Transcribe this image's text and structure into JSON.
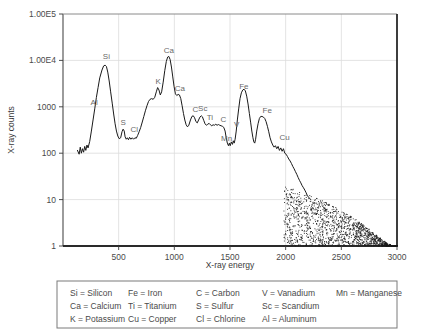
{
  "chart_data": {
    "type": "line",
    "title": "",
    "xlabel": "X-ray energy",
    "ylabel": "X-ray counts",
    "yscale": "log",
    "ylim": [
      1,
      100000
    ],
    "xlim": [
      0,
      3000
    ],
    "grid": true,
    "legend_position": "below-plot",
    "x_ticks": [
      "500",
      "1000",
      "1500",
      "2000",
      "2500",
      "3000"
    ],
    "x_tick_values": [
      500,
      1000,
      1500,
      2000,
      2500,
      3000
    ],
    "y_ticks": [
      "1.00E5",
      "1.00E4",
      "1000",
      "100",
      "10",
      "1"
    ],
    "y_tick_values": [
      100000,
      10000,
      1000,
      100,
      10,
      1
    ],
    "peak_annotations": [
      {
        "label": "Al",
        "x": 280,
        "y": 900
      },
      {
        "label": "Si",
        "x": 390,
        "y": 9000
      },
      {
        "label": "S",
        "x": 540,
        "y": 330
      },
      {
        "label": "Cl",
        "x": 640,
        "y": 230
      },
      {
        "label": "K",
        "x": 855,
        "y": 2600
      },
      {
        "label": "Ca",
        "x": 950,
        "y": 12000
      },
      {
        "label": "Ca",
        "x": 1050,
        "y": 1800
      },
      {
        "label": "C",
        "x": 1190,
        "y": 620
      },
      {
        "label": "Sc",
        "x": 1255,
        "y": 650
      },
      {
        "label": "Ti",
        "x": 1320,
        "y": 430
      },
      {
        "label": "C",
        "x": 1440,
        "y": 380
      },
      {
        "label": "Mn",
        "x": 1470,
        "y": 150
      },
      {
        "label": "V",
        "x": 1560,
        "y": 300
      },
      {
        "label": "Fe",
        "x": 1625,
        "y": 2000
      },
      {
        "label": "Fe",
        "x": 1835,
        "y": 600
      },
      {
        "label": "Cu",
        "x": 1990,
        "y": 160
      }
    ],
    "series": [
      {
        "name": "EDS spectrum",
        "points": [
          [
            130,
            115
          ],
          [
            145,
            95
          ],
          [
            155,
            135
          ],
          [
            165,
            100
          ],
          [
            175,
            125
          ],
          [
            185,
            105
          ],
          [
            195,
            140
          ],
          [
            205,
            115
          ],
          [
            215,
            150
          ],
          [
            225,
            130
          ],
          [
            240,
            180
          ],
          [
            255,
            300
          ],
          [
            270,
            520
          ],
          [
            285,
            900
          ],
          [
            300,
            1600
          ],
          [
            315,
            2600
          ],
          [
            330,
            4200
          ],
          [
            350,
            6200
          ],
          [
            365,
            7600
          ],
          [
            378,
            7900
          ],
          [
            390,
            7400
          ],
          [
            402,
            5600
          ],
          [
            415,
            3600
          ],
          [
            428,
            2100
          ],
          [
            442,
            1200
          ],
          [
            455,
            700
          ],
          [
            468,
            430
          ],
          [
            480,
            300
          ],
          [
            492,
            235
          ],
          [
            505,
            205
          ],
          [
            518,
            215
          ],
          [
            530,
            290
          ],
          [
            540,
            330
          ],
          [
            550,
            300
          ],
          [
            558,
            225
          ],
          [
            568,
            200
          ],
          [
            578,
            215
          ],
          [
            588,
            195
          ],
          [
            598,
            220
          ],
          [
            610,
            200
          ],
          [
            622,
            215
          ],
          [
            634,
            200
          ],
          [
            646,
            215
          ],
          [
            658,
            210
          ],
          [
            670,
            240
          ],
          [
            684,
            290
          ],
          [
            698,
            360
          ],
          [
            712,
            470
          ],
          [
            726,
            620
          ],
          [
            740,
            820
          ],
          [
            754,
            1050
          ],
          [
            768,
            1300
          ],
          [
            782,
            1450
          ],
          [
            796,
            1500
          ],
          [
            810,
            1450
          ],
          [
            824,
            1600
          ],
          [
            838,
            2100
          ],
          [
            850,
            2600
          ],
          [
            862,
            2300
          ],
          [
            874,
            1800
          ],
          [
            886,
            2100
          ],
          [
            900,
            3400
          ],
          [
            914,
            6000
          ],
          [
            928,
            9500
          ],
          [
            940,
            11800
          ],
          [
            950,
            12200
          ],
          [
            962,
            10500
          ],
          [
            974,
            7200
          ],
          [
            986,
            4400
          ],
          [
            998,
            2700
          ],
          [
            1010,
            1900
          ],
          [
            1022,
            1750
          ],
          [
            1034,
            1850
          ],
          [
            1046,
            1800
          ],
          [
            1058,
            1500
          ],
          [
            1070,
            1050
          ],
          [
            1082,
            720
          ],
          [
            1094,
            520
          ],
          [
            1106,
            410
          ],
          [
            1118,
            370
          ],
          [
            1130,
            400
          ],
          [
            1145,
            520
          ],
          [
            1158,
            620
          ],
          [
            1170,
            640
          ],
          [
            1182,
            580
          ],
          [
            1194,
            480
          ],
          [
            1206,
            450
          ],
          [
            1218,
            520
          ],
          [
            1230,
            600
          ],
          [
            1242,
            640
          ],
          [
            1252,
            610
          ],
          [
            1264,
            510
          ],
          [
            1276,
            430
          ],
          [
            1288,
            400
          ],
          [
            1300,
            420
          ],
          [
            1312,
            440
          ],
          [
            1324,
            410
          ],
          [
            1336,
            390
          ],
          [
            1348,
            410
          ],
          [
            1360,
            400
          ],
          [
            1372,
            420
          ],
          [
            1384,
            400
          ],
          [
            1396,
            415
          ],
          [
            1408,
            400
          ],
          [
            1420,
            390
          ],
          [
            1432,
            380
          ],
          [
            1444,
            360
          ],
          [
            1456,
            300
          ],
          [
            1466,
            215
          ],
          [
            1476,
            165
          ],
          [
            1486,
            145
          ],
          [
            1494,
            165
          ],
          [
            1502,
            145
          ],
          [
            1512,
            175
          ],
          [
            1522,
            155
          ],
          [
            1530,
            185
          ],
          [
            1538,
            165
          ],
          [
            1546,
            200
          ],
          [
            1556,
            300
          ],
          [
            1566,
            520
          ],
          [
            1578,
            900
          ],
          [
            1590,
            1500
          ],
          [
            1602,
            2000
          ],
          [
            1614,
            2300
          ],
          [
            1626,
            2400
          ],
          [
            1638,
            2200
          ],
          [
            1650,
            1700
          ],
          [
            1662,
            1150
          ],
          [
            1674,
            720
          ],
          [
            1686,
            450
          ],
          [
            1696,
            300
          ],
          [
            1706,
            215
          ],
          [
            1714,
            175
          ],
          [
            1722,
            165
          ],
          [
            1730,
            200
          ],
          [
            1740,
            300
          ],
          [
            1752,
            430
          ],
          [
            1764,
            560
          ],
          [
            1776,
            620
          ],
          [
            1788,
            620
          ],
          [
            1800,
            600
          ],
          [
            1812,
            560
          ],
          [
            1824,
            480
          ],
          [
            1836,
            380
          ],
          [
            1848,
            290
          ],
          [
            1860,
            215
          ],
          [
            1872,
            175
          ],
          [
            1884,
            150
          ],
          [
            1896,
            135
          ],
          [
            1908,
            145
          ],
          [
            1920,
            125
          ],
          [
            1932,
            140
          ],
          [
            1944,
            115
          ],
          [
            1956,
            130
          ],
          [
            1968,
            110
          ],
          [
            1980,
            125
          ],
          [
            1992,
            100
          ],
          [
            2004,
            95
          ],
          [
            2016,
            85
          ],
          [
            2028,
            75
          ],
          [
            2040,
            68
          ],
          [
            2052,
            60
          ],
          [
            2064,
            52
          ],
          [
            2076,
            46
          ],
          [
            2088,
            40
          ],
          [
            2100,
            35
          ],
          [
            2112,
            30
          ],
          [
            2124,
            26
          ],
          [
            2136,
            23
          ],
          [
            2148,
            20
          ],
          [
            2160,
            18
          ],
          [
            2172,
            16
          ],
          [
            2184,
            14
          ],
          [
            2196,
            12
          ],
          [
            2210,
            11
          ],
          [
            2225,
            10
          ]
        ]
      }
    ],
    "noise_cloud": {
      "description": "scattered low-count points at high energy",
      "x_range": [
        1980,
        3000
      ],
      "y_range": [
        1,
        20
      ]
    }
  },
  "legend": {
    "rows": [
      [
        "Si = Silicon",
        "Fe = Iron",
        "C = Carbon",
        "V = Vanadium",
        "Mn = Manganese"
      ],
      [
        "Ca = Calcium",
        "Ti = Titanium",
        "S = Sulfur",
        "Sc = Scandium",
        ""
      ],
      [
        "K = Potassium",
        "Cu = Copper",
        "Cl = Chlorine",
        "Al = Aluminum",
        ""
      ]
    ]
  },
  "colors": {
    "line": "#1a1a1a",
    "grid": "#dcdcdc",
    "axis": "#3a3a3a",
    "text": "#4a4a4a",
    "background": "#ffffff"
  }
}
